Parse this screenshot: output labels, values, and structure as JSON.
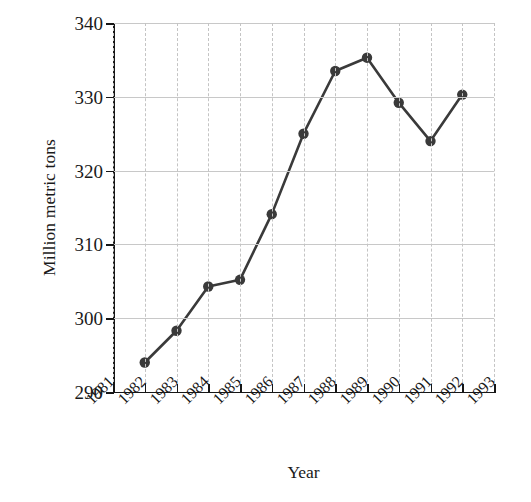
{
  "chart_data": {
    "type": "line",
    "title": "",
    "xlabel": "Year",
    "ylabel": "Million metric tons",
    "x": [
      1981,
      1982,
      1983,
      1984,
      1985,
      1986,
      1987,
      1988,
      1989,
      1990,
      1991,
      1992,
      1993
    ],
    "xtick_labels": [
      "1981",
      "1982",
      "1983",
      "1984",
      "1985",
      "1986",
      "1987",
      "1988",
      "1989",
      "1990",
      "1991",
      "1992",
      "1993"
    ],
    "xlim": [
      1981,
      1993
    ],
    "ylim": [
      290,
      340
    ],
    "ytick_labels": [
      "290",
      "300",
      "310",
      "320",
      "330",
      "340"
    ],
    "yticks": [
      290,
      300,
      310,
      320,
      330,
      340
    ],
    "grid": true,
    "grid_style": "horizontal solid, vertical dashed",
    "legend": "none",
    "marker": "filled circle",
    "series": [
      {
        "name": "Million metric tons",
        "x": [
          1982,
          1983,
          1984,
          1985,
          1986,
          1987,
          1988,
          1989,
          1990,
          1991,
          1992
        ],
        "values": [
          294.0,
          298.3,
          304.3,
          305.2,
          314.1,
          325.0,
          333.5,
          335.3,
          329.2,
          324.0,
          330.3
        ],
        "color": "#3a3a3a"
      }
    ]
  },
  "axes": {
    "x_title": "Year",
    "y_title": "Million metric tons"
  }
}
